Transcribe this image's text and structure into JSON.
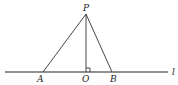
{
  "diagram": {
    "type": "geometry",
    "line_label": "l",
    "points": {
      "P": {
        "label": "P",
        "x": 86,
        "y": 14
      },
      "A": {
        "label": "A",
        "x": 43,
        "y": 72
      },
      "O": {
        "label": "O",
        "x": 86,
        "y": 72
      },
      "B": {
        "label": "B",
        "x": 112,
        "y": 72
      }
    },
    "segments": [
      "PA",
      "PB",
      "PO"
    ],
    "right_angle_at": "O",
    "colors": {
      "stroke": "#333333",
      "background": "#ffffff"
    }
  }
}
